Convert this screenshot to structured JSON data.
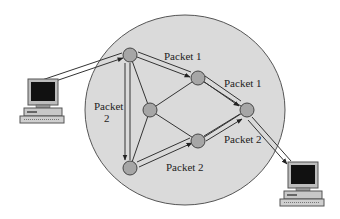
{
  "diagram": {
    "type": "packet-switching-network",
    "labels": {
      "packet1_top": "Packet 1",
      "packet1_right": "Packet 1",
      "packet2_left_line1": "Packet",
      "packet2_left_line2": "2",
      "packet2_bottom": "Packet 2",
      "packet2_right": "Packet 2"
    },
    "colors": {
      "network_fill": "#d9d9d9",
      "node_fill": "#a6a6a6",
      "line": "#333333"
    },
    "nodes": [
      {
        "id": "A",
        "x": 130,
        "y": 55
      },
      {
        "id": "B",
        "x": 198,
        "y": 78
      },
      {
        "id": "C",
        "x": 150,
        "y": 110
      },
      {
        "id": "D",
        "x": 247,
        "y": 110
      },
      {
        "id": "E",
        "x": 198,
        "y": 141
      },
      {
        "id": "F",
        "x": 130,
        "y": 168
      }
    ],
    "endpoints": [
      {
        "id": "source-computer"
      },
      {
        "id": "destination-computer"
      }
    ]
  }
}
